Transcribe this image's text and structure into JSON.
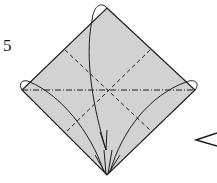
{
  "step": {
    "number": "5"
  },
  "colors": {
    "paper": "#d2d2d2",
    "line": "#1e1e1e",
    "background": "#ffffff"
  },
  "diagram": {
    "shape": "square-diamond",
    "vertices": {
      "top": [
        107,
        8
      ],
      "left": [
        22,
        90
      ],
      "right": [
        195,
        90
      ],
      "bottom": [
        107,
        175
      ]
    },
    "creases": [
      {
        "type": "mountain-fold (dash-dot)",
        "from": [
          22,
          90
        ],
        "to": [
          195,
          90
        ]
      },
      {
        "type": "valley-fold (dashed)",
        "from": [
          65,
          50
        ],
        "to": [
          150,
          130
        ]
      },
      {
        "type": "valley-fold (dashed)",
        "from": [
          150,
          50
        ],
        "to": [
          65,
          133
        ]
      }
    ],
    "arrows": [
      {
        "from": "top-corner",
        "to": "bottom-corner"
      },
      {
        "from": "left-corner",
        "to": "bottom-corner"
      },
      {
        "from": "right-corner",
        "to": "bottom-corner"
      }
    ],
    "symbol": "next-step-indicator"
  }
}
